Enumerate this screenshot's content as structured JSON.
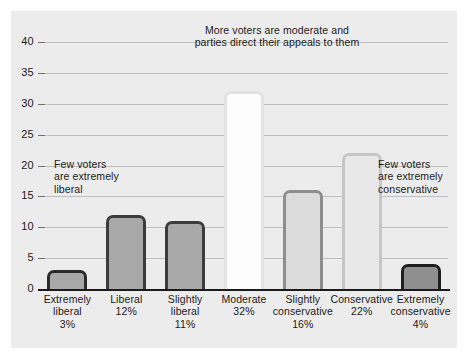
{
  "chart_data": {
    "type": "bar",
    "title": "",
    "xlabel": "",
    "ylabel": "",
    "ylim": [
      0,
      40
    ],
    "grid": true,
    "legend": "none",
    "categories": [
      "Extremely liberal",
      "Liberal",
      "Slightly liberal",
      "Moderate",
      "Slightly conservative",
      "Conservative",
      "Extremely conservative"
    ],
    "values": [
      3,
      12,
      11,
      32,
      16,
      22,
      4
    ],
    "value_labels": [
      "3%",
      "12%",
      "11%",
      "32%",
      "16%",
      "22%",
      "4%"
    ],
    "yticks": [
      0,
      5,
      10,
      15,
      20,
      25,
      30,
      35,
      40
    ],
    "annotations": [
      "More voters are moderate and parties direct their appeals to them",
      "Few voters are extremely liberal",
      "Few voters are extremely conservative"
    ]
  },
  "axis": {
    "ticks": [
      {
        "label": "40",
        "value": 40
      },
      {
        "label": "35",
        "value": 35
      },
      {
        "label": "30",
        "value": 30
      },
      {
        "label": "25",
        "value": 25
      },
      {
        "label": "20",
        "value": 20
      },
      {
        "label": "15",
        "value": 15
      },
      {
        "label": "10",
        "value": 10
      },
      {
        "label": "5",
        "value": 5
      },
      {
        "label": "0",
        "value": 0
      }
    ]
  },
  "bars": [
    {
      "name": "extremely-liberal",
      "label_line1": "Extremely",
      "label_line2": "liberal",
      "label_line3": "3%",
      "value": 3,
      "fill": "#a8a8a8",
      "border": "#2b2b2b"
    },
    {
      "name": "liberal",
      "label_line1": "Liberal",
      "label_line2": "12%",
      "label_line3": "",
      "value": 12,
      "fill": "#a8a8a8",
      "border": "#3c3c3c"
    },
    {
      "name": "slightly-liberal",
      "label_line1": "Slightly",
      "label_line2": "liberal",
      "label_line3": "11%",
      "value": 11,
      "fill": "#a8a8a8",
      "border": "#3c3c3c"
    },
    {
      "name": "moderate",
      "label_line1": "Moderate",
      "label_line2": "32%",
      "label_line3": "",
      "value": 32,
      "fill": "#fdfdfd",
      "border": "#e2e2e2"
    },
    {
      "name": "slightly-conservative",
      "label_line1": "Slightly",
      "label_line2": "conservative",
      "label_line3": "16%",
      "value": 16,
      "fill": "#dcdcdc",
      "border": "#8e8e8e"
    },
    {
      "name": "conservative",
      "label_line1": "Conservative",
      "label_line2": "22%",
      "label_line3": "",
      "value": 22,
      "fill": "#e8e8e8",
      "border": "#c6c6c6"
    },
    {
      "name": "extremely-conservative",
      "label_line1": "Extremely",
      "label_line2": "conservative",
      "label_line3": "4%",
      "value": 4,
      "fill": "#8f8f8f",
      "border": "#1f1f1f"
    }
  ],
  "annotations": {
    "top_line1": "More voters are moderate and",
    "top_line2": "parties direct their appeals to them",
    "left_line1": "Few voters",
    "left_line2": "are extremely",
    "left_line3": "liberal",
    "right_line1": "Few voters",
    "right_line2": "are extremely",
    "right_line3": "conservative"
  },
  "colors": {
    "panel_background": "#ececec",
    "page_background": "#ffffff",
    "gridline": "#bfbfbf",
    "axis": "#1b1b1b",
    "text": "#1b1b1b"
  }
}
